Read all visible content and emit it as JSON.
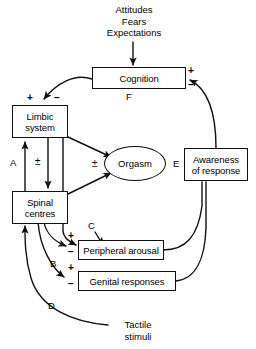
{
  "figure": {
    "type": "flow-diagram"
  },
  "inputs": {
    "top_stimulus": {
      "lines": [
        "Attitudes",
        "Fears",
        "Expectations"
      ]
    },
    "bottom_stimulus": {
      "lines": [
        "Tactile",
        "stimuli"
      ]
    }
  },
  "nodes": {
    "cognition": {
      "label": "Cognition",
      "shape": "box"
    },
    "limbic": {
      "label_line1": "Limbic",
      "label_line2": "system",
      "shape": "box"
    },
    "spinal": {
      "label_line1": "Spinal",
      "label_line2": "centres",
      "shape": "box"
    },
    "orgasm": {
      "label": "Orgasm",
      "shape": "ellipse"
    },
    "peripheral": {
      "label": "Peripheral arousal",
      "shape": "box"
    },
    "genital": {
      "label": "Genital responses",
      "shape": "box"
    },
    "awareness": {
      "label_line1": "Awareness",
      "label_line2": "of response",
      "shape": "box"
    }
  },
  "path_labels": {
    "a": "A",
    "b": "B",
    "c": "C",
    "d": "D",
    "e": "E",
    "f": "F"
  },
  "signs": {
    "cognition_right_plus": "+",
    "cognition_right_minus": "–",
    "limbic_top_plus": "+",
    "limbic_top_minus": "–",
    "limbic_spinal_pm": "±",
    "orgasm_pm": "±",
    "peripheral_plus": "+",
    "peripheral_minus": "–",
    "genital_plus": "+",
    "genital_minus": "–"
  },
  "colors": {
    "stroke": "#111111",
    "background": "#ffffff",
    "text": "#000000"
  }
}
